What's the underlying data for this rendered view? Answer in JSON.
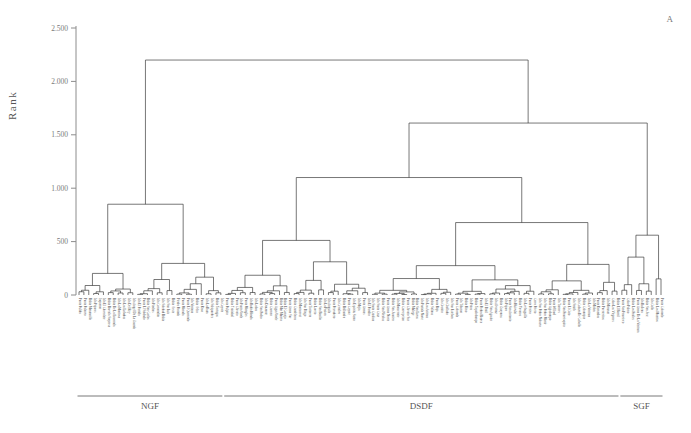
{
  "panel": {
    "label": "A"
  },
  "axis": {
    "ylabel": "Rank",
    "ticks": [
      0,
      500,
      1000,
      1500,
      2000,
      2500
    ],
    "tick_labels": [
      "0",
      "500",
      "1.000",
      "1.500",
      "2.000",
      "2.500"
    ],
    "ymin": 0,
    "ymax": 2500
  },
  "groups": [
    {
      "name": "NGF",
      "start_leaf": 0,
      "end_leaf": 29
    },
    {
      "name": "DSDF",
      "start_leaf": 30,
      "end_leaf": 110
    },
    {
      "name": "SGF",
      "start_leaf": 111,
      "end_leaf": 119
    }
  ],
  "colors": {
    "line": "#2e2e2e",
    "axis": "#8c8c8c",
    "text": "#4b4b4b"
  },
  "chart_data": {
    "type": "line",
    "title": "",
    "xlabel": "",
    "ylabel": "Rank",
    "ylim": [
      0,
      2500
    ],
    "grid": false,
    "legend": "none",
    "plot_kind": "dendrogram",
    "orientation": "vertical",
    "n_leaves": 120,
    "leaf_labels": [
      "Punta Pulida",
      "Punta Palanco",
      "Bahia Manzanillo",
      "Isla Pajaros",
      "Jaqueron",
      "Isla El Chocolate",
      "Bahia Barcala Sorpresa",
      "Bahia De La Ensenada",
      "Isla La Montosa",
      "Isla Las Lobadas",
      "Isla Del Rey",
      "Isla Angel De La Guarda",
      "Isla El Partida",
      "Punta El Soldado",
      "Bahia San Carlos",
      "Isla Piedras",
      "Isla Coronadito",
      "Isla Soledad Bahia",
      "Isla San Luis",
      "Bahia Oeste",
      "Piedra Pintada",
      "Punta Morada",
      "Punta El Quemado",
      "Isla Ventana",
      "Bahia Ocho",
      "Punta Raso",
      "Isla La Raza",
      "Isla Salsipuedes",
      "Bahia Tortugas",
      "Isla Coyote",
      "Punta Pulpito",
      "Bahia Trinidad",
      "Punta Chivato",
      "Isla Punta Verde",
      "Punta Mangles",
      "Isla Bahia Honda",
      "Isla Lobos",
      "Bahia San Pedro",
      "Isla Danzante",
      "Bahia Carmen",
      "Punta Agua Verde",
      "Bahia Mar Muerto",
      "Bahia El Conejo",
      "Punta Arena Sur",
      "Bahia Candeleros",
      "Isla Montserrat",
      "Isla San Diego",
      "Punta Tintorera",
      "Bahia Loreto",
      "Bahia San Basilio",
      "Isla La Pasion",
      "Isla Anguila",
      "Punta Pescadero",
      "Isla Cerralvo",
      "Bahia Ballandra",
      "Punta Coyote",
      "Isla Espiritu Santo",
      "Isla Mejia",
      "Punta Arenas",
      "Isla El Pardito",
      "Isla Santa Catalina",
      "Isla Santa Cruz",
      "Bahia San Nicolas",
      "Punta Arena Norte",
      "Bahia San Juanico",
      "Isla Monserrate",
      "Bahia Concepcion",
      "Punta Chivato Sur",
      "Bahia Mulege",
      "Bahia San Lucas",
      "Isla Partida Norte",
      "Isla Las Animas",
      "Bahia Salinas",
      "Punta Baja",
      "Isla Granito",
      "Isla Cholludo",
      "Isla San Esteban",
      "Punta Colorada",
      "Isla Tiburon",
      "Bahia Kino",
      "Isla Patos",
      "Bahia Topolobampo",
      "Punta Piedra Blanca",
      "Isla El Datil",
      "Bahia San Agustin",
      "Isla Alcatraz",
      "Bahia Guaymas",
      "Isla Pajaro",
      "Punta San Antonio",
      "Isla Huivulai",
      "Bahia Yavaros",
      "Isla Lechuguilla",
      "Punta Perico",
      "Cerro Prieto",
      "Isla San Pedro Nolasco",
      "Isla San Pedro Martir",
      "Bahia Agiabampo",
      "Punta Willard",
      "Isla Turners",
      "Bahia San Francisquito",
      "Punta El Gato",
      "Isla Smith",
      "Isla Cabeza De Caballo",
      "Bahia Calamajue",
      "Isla La Ventana",
      "Isla Mitlan",
      "Punta Remedios",
      "Bahia Puertecitos",
      "Isla Miramar",
      "Cabo Las Vírgenes",
      "Bahia El Barril",
      "Punta San Francisco",
      "Cabo Pulmo",
      "Bahia Los Frailes",
      "Punta Arena De La Ventana",
      "Isla Ballena",
      "Bahia San Jose",
      "Isla Gallo",
      "Bahia Los Muertos",
      "Punta Colorado",
      "La Paz"
    ],
    "merges": [
      {
        "h": 2200,
        "note": "root"
      },
      {
        "h": 1610,
        "note": "DSDF+SGF split"
      },
      {
        "h": 1390,
        "note": "SGF core"
      },
      {
        "h": 1100,
        "note": "DSDF main"
      },
      {
        "h": 850,
        "note": "NGF top"
      },
      {
        "h": 800,
        "note": "DSDF subcluster"
      },
      {
        "h": 620,
        "note": "NGF mid"
      },
      {
        "h": 580,
        "note": "NGF split"
      },
      {
        "h": 560,
        "note": "DSDF sub"
      },
      {
        "h": 500,
        "note": "sub"
      },
      {
        "h": 420,
        "note": "sub"
      },
      {
        "h": 360,
        "note": "sub"
      },
      {
        "h": 300,
        "note": "sub"
      },
      {
        "h": 240,
        "note": "sub"
      },
      {
        "h": 180,
        "note": "sub"
      },
      {
        "h": 120,
        "note": "sub"
      },
      {
        "h": 80,
        "note": "sub"
      },
      {
        "h": 40,
        "note": "sub"
      }
    ]
  }
}
